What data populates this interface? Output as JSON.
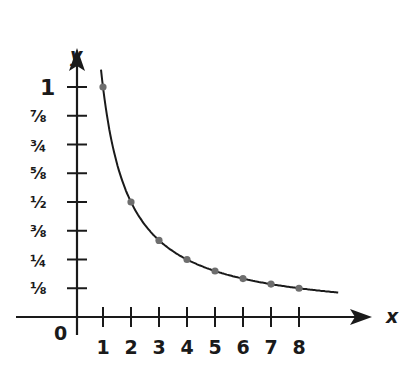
{
  "chart_data": {
    "type": "line",
    "title": "",
    "function": "y = 1/x",
    "xlabel": "x",
    "ylabel": "y",
    "origin_label": "0",
    "x_ticks": [
      "1",
      "2",
      "3",
      "4",
      "5",
      "6",
      "7",
      "8"
    ],
    "y_ticks": [
      "1/8",
      "1/4",
      "3/8",
      "1/2",
      "5/8",
      "3/4",
      "7/8",
      "1"
    ],
    "y_tick_glyphs": [
      "⅛",
      "¼",
      "⅜",
      "½",
      "⅝",
      "¾",
      "⅞",
      "1"
    ],
    "points": [
      {
        "x": 1,
        "y": 1
      },
      {
        "x": 2,
        "y": 0.5
      },
      {
        "x": 3,
        "y": 0.333
      },
      {
        "x": 4,
        "y": 0.25
      },
      {
        "x": 5,
        "y": 0.2
      },
      {
        "x": 6,
        "y": 0.167
      },
      {
        "x": 7,
        "y": 0.143
      },
      {
        "x": 8,
        "y": 0.125
      }
    ],
    "curve_x_range": [
      0.93,
      9.4
    ],
    "xlim": [
      -0.9,
      9.8
    ],
    "ylim": [
      -0.12,
      1.3
    ],
    "grid": false,
    "legend": null,
    "colors": {
      "axis": "#1a1a1a",
      "curve": "#1a1a1a",
      "points": "#6e6e6e"
    }
  }
}
